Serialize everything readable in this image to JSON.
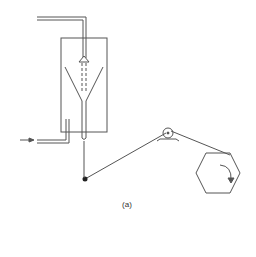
{
  "figure": {
    "caption": "(a)",
    "type": "schematic",
    "stroke_color": "#555555"
  },
  "components": [
    {
      "name": "feed-pipe",
      "label": ""
    },
    {
      "name": "vessel",
      "label": ""
    },
    {
      "name": "funnel",
      "label": ""
    },
    {
      "name": "inlet-pipe",
      "label": ""
    },
    {
      "name": "guide-pulley",
      "label": ""
    },
    {
      "name": "hexagonal-reel",
      "label": ""
    }
  ]
}
